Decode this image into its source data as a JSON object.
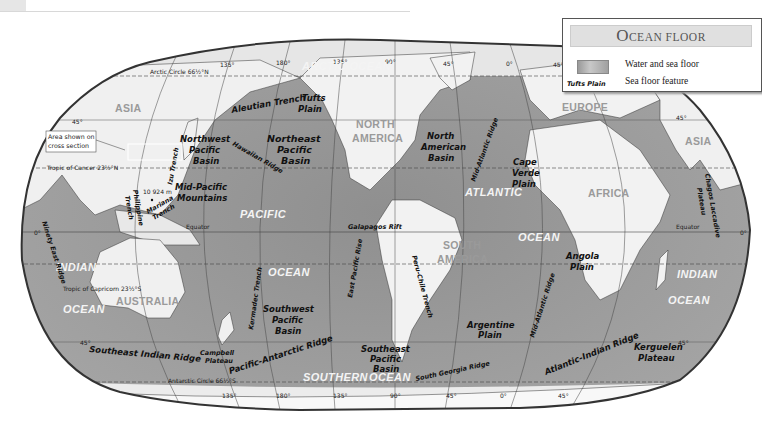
{
  "map": {
    "title": "Ocean Floor",
    "projection": "Robinson-like world map, grayscale relief"
  },
  "legend": {
    "title_first_letter": "O",
    "title_rest": "CEAN FLOOR",
    "items": [
      {
        "symbol": "water-swatch",
        "label": "Water and sea floor"
      },
      {
        "symbol_text": "Tufts Plain",
        "label": "Sea floor feature"
      }
    ]
  },
  "grid_labels": {
    "arctic_circle": "Arctic Circle 66½°N",
    "tropic_cancer": "Tropic of Cancer 23½°N",
    "equator_left": "Equator",
    "equator_right": "Equator",
    "tropic_capricorn": "Tropic of Capricorn 23½°S",
    "antarctic_circle": "Antarctic Circle 66½°S",
    "lat_45n_left": "45°",
    "lat_45n_right": "45°",
    "lat_0_left": "0°",
    "lat_0_right": "0°",
    "lat_45s_left": "45°",
    "lat_45s_right": "45°",
    "top_longitudes": [
      "135°",
      "180°",
      "135°",
      "90°",
      "45°",
      "0°",
      "45°"
    ],
    "bottom_longitudes": [
      "135°",
      "180°",
      "135°",
      "90°",
      "45°",
      "0°",
      "45°"
    ]
  },
  "continents": {
    "asia_west": "ASIA",
    "asia_east": "ASIA",
    "north_america_1": "NORTH",
    "north_america_2": "AMERICA",
    "south_america_1": "SOUTH",
    "south_america_2": "AMERICA",
    "europe": "EUROPE",
    "africa": "AFRICA",
    "australia": "AUSTRALIA"
  },
  "oceans": {
    "arctic": "ARCTIC OCEAN",
    "pacific_1": "PACIFIC",
    "pacific_2": "OCEAN",
    "atlantic_1": "ATLANTIC",
    "atlantic_2": "OCEAN",
    "indian_west_1": "INDIAN",
    "indian_west_2": "OCEAN",
    "indian_east_1": "INDIAN",
    "indian_east_2": "OCEAN",
    "southern_1": "SOUTHERN",
    "southern_2": "OCEAN"
  },
  "features": {
    "aleutian_trench": "Aleutian Trench",
    "tufts_plain_1": "Tufts",
    "tufts_plain_2": "Plain",
    "nw_pacific_basin": [
      "Northwest",
      "Pacific",
      "Basin"
    ],
    "ne_pacific_basin": [
      "Northeast",
      "Pacific",
      "Basin"
    ],
    "hawaiian_ridge": "Hawaiian Ridge",
    "izu_trench": "Izu Trench",
    "mid_pacific_mountains": [
      "Mid-Pacific",
      "Mountains"
    ],
    "philippine_trench": [
      "Philippine",
      "Trench"
    ],
    "mariana_trench": [
      "Mariana",
      "Trench"
    ],
    "mariana_depth": "10 924 m",
    "north_american_basin": [
      "North",
      "American",
      "Basin"
    ],
    "mid_atlantic_ridge_north": "Mid-Atlantic Ridge",
    "cape_verde_plain": [
      "Cape",
      "Verde",
      "Plain"
    ],
    "galapagos_rift": "Galapagos Rift",
    "east_pacific_rise": "East Pacific Rise",
    "peru_chile_trench": "Peru-Chile Trench",
    "angola_plain": [
      "Angola",
      "Plain"
    ],
    "mid_atlantic_ridge_south": "Mid-Atlantic Ridge",
    "chagos_laccadive_plateau": [
      "Chagos Laccadive",
      "Plateau"
    ],
    "ninety_east_ridge": "Ninety East Ridge",
    "kermadec_trench": "Kermadec Trench",
    "sw_pacific_basin": [
      "Southwest",
      "Pacific",
      "Basin"
    ],
    "se_pacific_basin": [
      "Southeast",
      "Pacific",
      "Basin"
    ],
    "argentine_plain": [
      "Argentine",
      "Plain"
    ],
    "southeast_indian_ridge": "Southeast Indian Ridge",
    "campbell_plateau": [
      "Campbell",
      "Plateau"
    ],
    "pacific_antarctic_ridge": "Pacific-Antarctic Ridge",
    "south_georgia_ridge": "South Georgia Ridge",
    "atlantic_indian_ridge": "Atlantic-Indian Ridge",
    "kerguelen_plateau": [
      "Kerguelen",
      "Plateau"
    ]
  },
  "callout": {
    "line1": "Area shown on",
    "line2": "cross section"
  },
  "colors": {
    "land": "#f2f2f2",
    "ocean_deep": "#8e8e8e",
    "ocean_shelf": "#bcbcbc",
    "border": "#333333"
  }
}
